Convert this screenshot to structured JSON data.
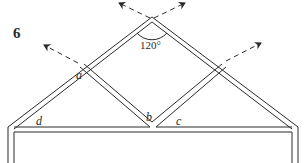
{
  "figure": {
    "number": "6",
    "angle_label": "120°",
    "angle_labels": {
      "a": "a",
      "b": "b",
      "c": "c",
      "d": "d"
    },
    "colors": {
      "line": "#2a2a2a",
      "background": "#ffffff"
    }
  }
}
